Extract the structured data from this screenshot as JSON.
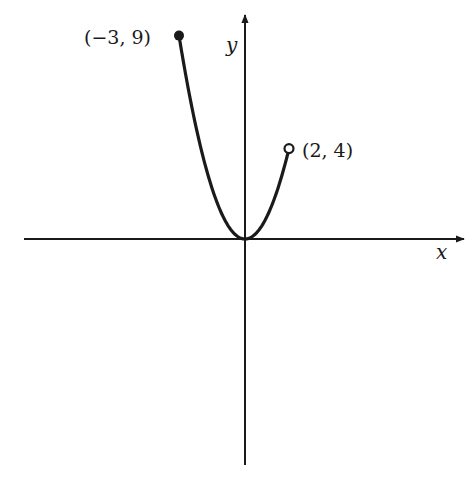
{
  "chart_data": {
    "type": "line",
    "title": "",
    "xlabel": "x",
    "ylabel": "y",
    "function": "y = x^2",
    "domain": [
      -3,
      2
    ],
    "domain_notation": "[-3, 2)",
    "series": [
      {
        "name": "y = x^2",
        "x": [
          -3,
          -2.5,
          -2,
          -1.5,
          -1,
          -0.5,
          0,
          0.5,
          1,
          1.5,
          2
        ],
        "y": [
          9,
          6.25,
          4,
          2.25,
          1,
          0.25,
          0,
          0.25,
          1,
          2.25,
          4
        ]
      }
    ],
    "endpoints": [
      {
        "x": -3,
        "y": 9,
        "label": "(−3, 9)",
        "type": "closed"
      },
      {
        "x": 2,
        "y": 4,
        "label": "(2, 4)",
        "type": "open"
      }
    ],
    "grid": false,
    "ticks": false
  },
  "labels": {
    "left_endpoint": "(−3, 9)",
    "right_endpoint": "(2, 4)",
    "x_axis": "x",
    "y_axis": "y"
  },
  "colors": {
    "ink": "#1a1a1a",
    "background": "#ffffff"
  }
}
